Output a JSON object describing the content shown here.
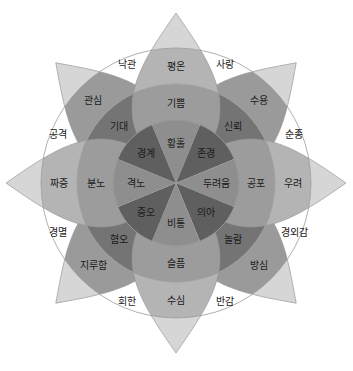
{
  "diagram": {
    "title": "",
    "center": [
      176,
      183
    ],
    "radii": {
      "inner": 63,
      "middle": 99,
      "outer": 135,
      "tip": 170
    },
    "colors": {
      "core_cross": "#8e8e8e",
      "core_diag": "#5f5f5f",
      "mid_cross": "#9c9c9c",
      "mid_diag": "#747474",
      "outer_cross": "#b4b4b4",
      "outer_diag": "#9a9a9a",
      "tip": "#d6d6d6",
      "ring_stroke": "#9a9a9a",
      "text": "#1a1a1a"
    },
    "petals": [
      {
        "direction": "north",
        "angle": -90,
        "kind": "cross",
        "core": "황홀",
        "middle": "기쁨",
        "outer": "평온"
      },
      {
        "direction": "northeast",
        "angle": -45,
        "kind": "diag",
        "core": "존경",
        "middle": "신뢰",
        "outer": "수용"
      },
      {
        "direction": "east",
        "angle": 0,
        "kind": "cross",
        "core": "두려움",
        "middle": "공포",
        "outer": "우려"
      },
      {
        "direction": "southeast",
        "angle": 45,
        "kind": "diag",
        "core": "의아",
        "middle": "놀람",
        "outer": "방심"
      },
      {
        "direction": "south",
        "angle": 90,
        "kind": "cross",
        "core": "비통",
        "middle": "슬픔",
        "outer": "수심"
      },
      {
        "direction": "southwest",
        "angle": 135,
        "kind": "diag",
        "core": "증오",
        "middle": "혐오",
        "outer": "지루함"
      },
      {
        "direction": "west",
        "angle": 180,
        "kind": "cross",
        "core": "격노",
        "middle": "분노",
        "outer": "짜증"
      },
      {
        "direction": "northwest",
        "angle": -135,
        "kind": "diag",
        "core": "경계",
        "middle": "기대",
        "outer": "관심"
      }
    ],
    "dyads": [
      {
        "angle": -67.5,
        "label": "사랑"
      },
      {
        "angle": -22.5,
        "label": "순종"
      },
      {
        "angle": 22.5,
        "label": "경외감"
      },
      {
        "angle": 67.5,
        "label": "반감"
      },
      {
        "angle": 112.5,
        "label": "회한"
      },
      {
        "angle": 157.5,
        "label": "경멸"
      },
      {
        "angle": -157.5,
        "label": "공격"
      },
      {
        "angle": -112.5,
        "label": "낙관"
      }
    ]
  }
}
